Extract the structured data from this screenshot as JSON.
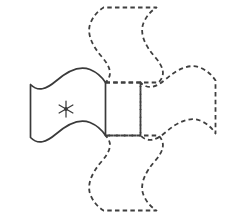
{
  "figure": {
    "background_color": "#ffffff",
    "stroke_color": "#3a3a3a",
    "dashed_stroke_color": "#3f3f3f",
    "canvas": {
      "width": 235,
      "height": 224
    },
    "marker": {
      "name": "asterisk",
      "glyph": "*",
      "points": 6,
      "center_x": 66,
      "center_y": 109,
      "radius": 8
    },
    "shapes": [
      {
        "name": "flag-original",
        "style": "solid",
        "position": "left",
        "label": "original flag with asterisk",
        "path": "M 30.5 84.5 L 30.5 137.5 C 38 145 46 142.5 56 134 C 68 123.5 80 118.5 90 122.5 C 97 125.4 102 130 105.5 135.5 L 105.5 82.5 C 102 77 97 72.4 90 69.5 C 80 65.5 68 70.5 56 81 C 46 89.5 38 92 30.5 84.5 Z"
      },
      {
        "name": "flag-copy-top",
        "style": "dashed",
        "position": "top",
        "label": "dashed copy above",
        "path": "M 105.5 82.5 L 158.5 82.5 C 166 75 163.5 67 155 57 C 144.5 45 139.5 33 143.5 23 C 146.4 16 151 11 156.5 7.5 L 103.5 7.5 C 98 11 93.4 16 90.5 23 C 86.5 33 91.5 45 102 57 C 110.5 67 113 75 105.5 82.5 Z"
      },
      {
        "name": "flag-copy-right",
        "style": "dashed",
        "position": "right",
        "label": "dashed copy at right",
        "path": "M 140.5 82.5 L 140.5 135.5 C 148 143 156 140.5 166 132 C 178 121.5 190 116.5 200 120.5 C 207 123.4 212 128 215.5 133.5 L 215.5 80.5 C 212 75 207 70.4 200 67.5 C 190 63.5 178 68.5 166 79 C 156 87.5 148 90 140.5 82.5 Z"
      },
      {
        "name": "flag-copy-bottom",
        "style": "dashed",
        "position": "bottom",
        "label": "dashed copy below",
        "path": "M 105.5 135.5 L 158.5 135.5 C 166 143 163.5 151 155 161 C 144.5 173 139.5 185 143.5 195 C 146.4 202 151 207 156.5 210.5 L 103.5 210.5 C 98 207 93.4 202 90.5 195 C 86.5 185 91.5 173 102 161 C 110.5 151 113 143 105.5 135.5 Z"
      },
      {
        "name": "central-square",
        "style": "dashed",
        "position": "center",
        "label": "central square junction",
        "path": "M 105.5 82.5 L 140.5 82.5 L 140.5 135.5 L 105.5 135.5"
      }
    ]
  }
}
